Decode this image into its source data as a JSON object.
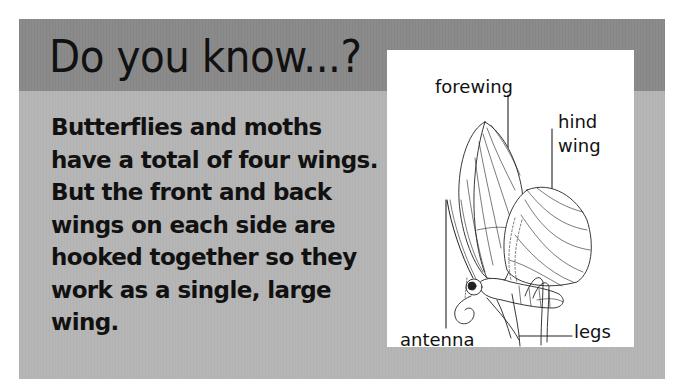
{
  "panel": {
    "title": "Do you know...?",
    "body": "Butterflies and moths have a total of four wings. But the front and back wings on each side are hooked together so they work as a single, large wing.",
    "colors": {
      "header_band": "#8b8b8b",
      "panel_background": "#b6b6b6",
      "figure_background": "#ffffff",
      "text": "#111111"
    }
  },
  "figure": {
    "labels": {
      "forewing": "forewing",
      "hind_wing_line1": "hind",
      "hind_wing_line2": "wing",
      "antenna": "antenna",
      "legs": "legs"
    }
  }
}
